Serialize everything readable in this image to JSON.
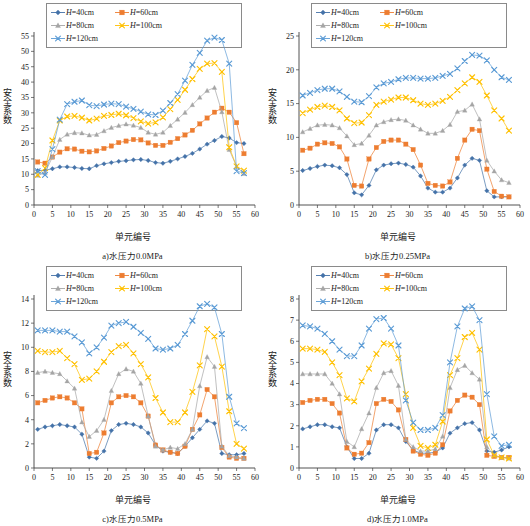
{
  "figure": {
    "panels": [
      "a",
      "b",
      "c",
      "d"
    ],
    "legend": [
      {
        "label": "H=40cm",
        "series": "H40",
        "color": "#4472a8",
        "marker": "diamond"
      },
      {
        "label": "H=60cm",
        "series": "H60",
        "color": "#ed7d31",
        "marker": "square"
      },
      {
        "label": "H=80cm",
        "series": "H80",
        "color": "#a5a5a5",
        "marker": "triangle"
      },
      {
        "label": "H=100cm",
        "series": "H100",
        "color": "#ffc000",
        "marker": "x"
      },
      {
        "label": "H=120cm",
        "series": "H120",
        "color": "#5b9bd5",
        "marker": "x"
      }
    ],
    "xlabel": "单元编号",
    "ylabel": "安全系数"
  },
  "chart_data": [
    {
      "type": "line",
      "panel": "a",
      "caption": "a)水压力0.0MPa",
      "title": "",
      "xlabel": "单元编号",
      "ylabel": "安全系数",
      "xlim": [
        0,
        60
      ],
      "ylim": [
        0,
        55
      ],
      "xticks": [
        0,
        5,
        10,
        15,
        20,
        25,
        30,
        35,
        40,
        45,
        50,
        55,
        60
      ],
      "yticks": [
        0,
        5,
        10,
        15,
        20,
        25,
        30,
        35,
        40,
        45,
        50,
        55
      ],
      "grid": false,
      "legend_position": "top",
      "x": [
        1,
        3,
        5,
        7,
        9,
        11,
        13,
        15,
        17,
        19,
        21,
        23,
        25,
        27,
        29,
        31,
        33,
        35,
        37,
        39,
        41,
        43,
        45,
        47,
        49,
        51,
        53,
        55,
        57
      ],
      "series": [
        {
          "name": "H=40cm",
          "color": "#4472a8",
          "marker": "diamond",
          "values": [
            11.2,
            11.3,
            11.8,
            12.4,
            12.4,
            12.2,
            11.9,
            11.8,
            12.8,
            13.4,
            13.8,
            14.2,
            14.4,
            14.7,
            14.8,
            14.5,
            13.8,
            13.6,
            14.2,
            15.0,
            15.8,
            16.8,
            18.2,
            19.8,
            21.0,
            22.3,
            21.8,
            20.3,
            20.0
          ]
        },
        {
          "name": "H=60cm",
          "color": "#ed7d31",
          "marker": "square",
          "values": [
            14.0,
            13.6,
            15.6,
            17.2,
            18.3,
            18.2,
            17.5,
            17.3,
            17.6,
            18.4,
            19.2,
            20.3,
            20.8,
            21.3,
            21.2,
            20.2,
            19.4,
            19.4,
            20.4,
            21.6,
            22.8,
            24.3,
            26.4,
            28.3,
            30.2,
            31.5,
            30.2,
            26.8,
            16.7
          ]
        },
        {
          "name": "H=80cm",
          "color": "#a5a5a5",
          "marker": "triangle",
          "values": [
            9.6,
            10.5,
            15.6,
            21.3,
            23.0,
            23.5,
            23.4,
            22.7,
            22.9,
            24.1,
            25.2,
            25.8,
            26.3,
            25.9,
            25.2,
            23.6,
            23.0,
            23.6,
            25.8,
            27.9,
            30.1,
            32.6,
            35.0,
            37.2,
            38.2,
            30.3,
            18.0,
            12.5,
            10.2
          ]
        },
        {
          "name": "H=100cm",
          "color": "#ffc000",
          "marker": "x",
          "values": [
            9.8,
            12.0,
            21.0,
            27.5,
            28.8,
            29.0,
            28.4,
            27.5,
            28.1,
            29.0,
            29.3,
            29.7,
            29.2,
            28.3,
            27.2,
            26.5,
            26.9,
            28.5,
            31.2,
            34.2,
            37.5,
            41.0,
            44.3,
            46.0,
            46.2,
            43.3,
            18.8,
            12.6,
            11.2
          ]
        },
        {
          "name": "H=120cm",
          "color": "#5b9bd5",
          "marker": "x",
          "values": [
            11.0,
            9.8,
            18.2,
            27.8,
            32.8,
            33.6,
            34.0,
            32.5,
            32.2,
            32.7,
            33.0,
            32.8,
            32.0,
            31.3,
            30.4,
            29.5,
            29.3,
            30.7,
            33.2,
            36.1,
            40.5,
            45.6,
            49.5,
            53.5,
            54.5,
            53.7,
            46.0,
            11.0,
            10.4
          ]
        }
      ]
    },
    {
      "type": "line",
      "panel": "b",
      "caption": "b)水压力0.25MPa",
      "title": "",
      "xlabel": "单元编号",
      "ylabel": "安全系数",
      "xlim": [
        0,
        60
      ],
      "ylim": [
        0,
        25
      ],
      "xticks": [
        0,
        5,
        10,
        15,
        20,
        25,
        30,
        35,
        40,
        45,
        50,
        55,
        60
      ],
      "yticks": [
        0,
        5,
        10,
        15,
        20,
        25
      ],
      "grid": false,
      "legend_position": "top",
      "x": [
        1,
        3,
        5,
        7,
        9,
        11,
        13,
        15,
        17,
        19,
        21,
        23,
        25,
        27,
        29,
        31,
        33,
        35,
        37,
        39,
        41,
        43,
        45,
        47,
        49,
        51,
        53,
        55,
        57
      ],
      "series": [
        {
          "name": "H=40cm",
          "color": "#4472a8",
          "marker": "diamond",
          "values": [
            5.1,
            5.4,
            5.7,
            5.9,
            5.8,
            5.5,
            4.5,
            1.8,
            1.5,
            2.9,
            5.2,
            5.9,
            6.1,
            6.2,
            6.0,
            5.6,
            4.3,
            2.5,
            1.9,
            1.9,
            2.5,
            4.0,
            5.9,
            6.9,
            6.6,
            2.1,
            1.2,
            1.2,
            1.2
          ]
        },
        {
          "name": "H=60cm",
          "color": "#ed7d31",
          "marker": "square",
          "values": [
            8.1,
            8.4,
            9.0,
            9.2,
            9.1,
            8.6,
            6.8,
            2.9,
            2.8,
            6.8,
            8.5,
            9.4,
            9.6,
            9.6,
            9.0,
            8.2,
            5.9,
            3.2,
            2.9,
            2.8,
            3.4,
            6.9,
            9.6,
            11.2,
            11.0,
            5.3,
            2.0,
            1.3,
            1.2
          ]
        },
        {
          "name": "H=80cm",
          "color": "#a5a5a5",
          "marker": "triangle",
          "values": [
            10.8,
            11.3,
            11.8,
            11.9,
            11.8,
            11.4,
            10.2,
            8.9,
            9.1,
            10.3,
            11.8,
            12.3,
            12.6,
            12.7,
            12.5,
            11.8,
            11.2,
            10.6,
            10.6,
            11.0,
            11.9,
            13.8,
            14.0,
            14.9,
            12.7,
            6.6,
            5.0,
            3.7,
            3.3
          ]
        },
        {
          "name": "H=100cm",
          "color": "#ffc000",
          "marker": "x",
          "values": [
            13.6,
            14.1,
            14.5,
            14.7,
            14.5,
            14.0,
            12.8,
            12.1,
            12.2,
            13.3,
            14.8,
            15.3,
            15.6,
            15.9,
            15.9,
            15.5,
            15.0,
            14.8,
            15.0,
            15.4,
            16.0,
            17.0,
            18.0,
            18.9,
            18.2,
            16.2,
            14.0,
            12.8,
            11.0
          ]
        },
        {
          "name": "H=120cm",
          "color": "#5b9bd5",
          "marker": "x",
          "values": [
            16.2,
            16.6,
            17.0,
            17.2,
            17.2,
            16.8,
            16.0,
            15.3,
            15.2,
            16.1,
            17.4,
            18.0,
            18.2,
            18.6,
            18.8,
            18.8,
            18.7,
            18.7,
            18.8,
            19.1,
            19.4,
            20.2,
            21.3,
            22.2,
            22.1,
            21.4,
            20.0,
            18.9,
            18.5
          ]
        }
      ]
    },
    {
      "type": "line",
      "panel": "c",
      "caption": "c)水压力0.5MPa",
      "title": "",
      "xlabel": "单元编号",
      "ylabel": "安全系数",
      "xlim": [
        0,
        60
      ],
      "ylim": [
        0,
        14
      ],
      "xticks": [
        0,
        5,
        10,
        15,
        20,
        25,
        30,
        35,
        40,
        45,
        50,
        55,
        60
      ],
      "yticks": [
        0,
        2,
        4,
        6,
        8,
        10,
        12,
        14
      ],
      "grid": false,
      "legend_position": "top",
      "x": [
        1,
        3,
        5,
        7,
        9,
        11,
        13,
        15,
        17,
        19,
        21,
        23,
        25,
        27,
        29,
        31,
        33,
        35,
        37,
        39,
        41,
        43,
        45,
        47,
        49,
        51,
        53,
        55,
        57
      ],
      "series": [
        {
          "name": "H=40cm",
          "color": "#4472a8",
          "marker": "diamond",
          "values": [
            3.2,
            3.4,
            3.5,
            3.6,
            3.5,
            3.4,
            2.8,
            0.9,
            0.8,
            1.4,
            3.1,
            3.6,
            3.7,
            3.6,
            3.4,
            2.9,
            1.9,
            1.4,
            1.3,
            1.2,
            1.8,
            2.5,
            3.2,
            3.9,
            3.7,
            1.2,
            1.1,
            1.1,
            1.2
          ]
        },
        {
          "name": "H=60cm",
          "color": "#ed7d31",
          "marker": "square",
          "values": [
            5.4,
            5.6,
            5.8,
            5.9,
            5.8,
            5.4,
            4.9,
            1.2,
            1.3,
            2.9,
            5.4,
            5.9,
            6.0,
            5.9,
            5.4,
            4.3,
            1.9,
            1.5,
            1.3,
            1.2,
            1.8,
            3.2,
            4.4,
            6.5,
            5.9,
            1.7,
            0.9,
            0.8,
            0.8
          ]
        },
        {
          "name": "H=80cm",
          "color": "#a5a5a5",
          "marker": "triangle",
          "values": [
            7.9,
            8.0,
            7.9,
            7.8,
            7.2,
            6.6,
            3.8,
            2.6,
            3.1,
            4.0,
            6.4,
            7.8,
            8.2,
            8.0,
            7.0,
            4.3,
            1.8,
            1.5,
            1.7,
            1.6,
            2.0,
            3.2,
            6.8,
            9.2,
            8.4,
            1.8,
            1.0,
            0.9,
            0.8
          ]
        },
        {
          "name": "H=100cm",
          "color": "#ffc000",
          "marker": "x",
          "values": [
            9.7,
            9.6,
            9.6,
            9.7,
            9.1,
            8.6,
            7.3,
            7.4,
            8.0,
            8.8,
            9.6,
            10.1,
            10.2,
            9.5,
            8.6,
            7.5,
            5.8,
            4.6,
            3.8,
            3.8,
            4.6,
            6.3,
            8.5,
            11.5,
            10.9,
            8.4,
            4.7,
            2.0,
            1.6
          ]
        },
        {
          "name": "H=120cm",
          "color": "#5b9bd5",
          "marker": "x",
          "values": [
            11.4,
            11.4,
            11.4,
            11.3,
            11.3,
            10.9,
            10.4,
            9.5,
            10.0,
            10.8,
            11.8,
            12.0,
            12.1,
            11.7,
            11.2,
            10.7,
            9.9,
            9.8,
            9.9,
            10.2,
            11.1,
            12.2,
            13.4,
            13.6,
            13.3,
            11.1,
            5.9,
            3.7,
            3.3
          ]
        }
      ]
    },
    {
      "type": "line",
      "panel": "d",
      "caption": "d)水压力1.0MPa",
      "title": "",
      "xlabel": "单元编号",
      "ylabel": "安全系数",
      "xlim": [
        0,
        60
      ],
      "ylim": [
        0,
        8
      ],
      "xticks": [
        0,
        5,
        10,
        15,
        20,
        25,
        30,
        35,
        40,
        45,
        50,
        55,
        60
      ],
      "yticks": [
        0,
        1,
        2,
        3,
        4,
        5,
        6,
        7,
        8
      ],
      "grid": false,
      "legend_position": "top",
      "x": [
        1,
        3,
        5,
        7,
        9,
        11,
        13,
        15,
        17,
        19,
        21,
        23,
        25,
        27,
        29,
        31,
        33,
        35,
        37,
        39,
        41,
        43,
        45,
        47,
        49,
        51,
        53,
        55,
        57
      ],
      "series": [
        {
          "name": "H=40cm",
          "color": "#4472a8",
          "marker": "diamond",
          "values": [
            1.85,
            1.95,
            2.05,
            2.05,
            1.95,
            1.9,
            1.0,
            0.45,
            0.45,
            0.7,
            1.8,
            2.05,
            2.05,
            1.9,
            1.25,
            0.85,
            0.7,
            0.7,
            0.75,
            0.95,
            1.65,
            1.9,
            2.1,
            2.15,
            1.8,
            0.8,
            0.75,
            0.85,
            1.0
          ]
        },
        {
          "name": "H=60cm",
          "color": "#ed7d31",
          "marker": "square",
          "values": [
            3.1,
            3.2,
            3.25,
            3.25,
            3.05,
            2.6,
            0.95,
            0.65,
            0.7,
            1.2,
            3.05,
            3.25,
            3.15,
            2.75,
            1.35,
            0.8,
            0.65,
            0.6,
            0.7,
            1.1,
            2.7,
            3.2,
            3.45,
            3.35,
            3.0,
            0.6,
            0.55,
            0.5,
            0.5
          ]
        },
        {
          "name": "H=80cm",
          "color": "#a5a5a5",
          "marker": "triangle",
          "values": [
            4.45,
            4.45,
            4.45,
            4.45,
            4.0,
            3.5,
            1.25,
            1.0,
            1.85,
            2.6,
            3.8,
            4.5,
            4.6,
            3.9,
            1.35,
            1.0,
            0.8,
            0.8,
            0.9,
            1.5,
            3.8,
            4.65,
            4.85,
            4.5,
            4.2,
            1.0,
            0.6,
            0.5,
            0.45
          ]
        },
        {
          "name": "H=100cm",
          "color": "#ffc000",
          "marker": "x",
          "values": [
            5.65,
            5.65,
            5.6,
            5.5,
            5.0,
            4.4,
            3.3,
            3.15,
            4.1,
            4.7,
            5.4,
            5.9,
            5.85,
            5.2,
            3.5,
            1.9,
            1.05,
            0.95,
            1.1,
            2.2,
            4.4,
            5.2,
            6.2,
            6.4,
            5.6,
            1.35,
            0.6,
            0.5,
            0.45
          ]
        },
        {
          "name": "H=120cm",
          "color": "#5b9bd5",
          "marker": "x",
          "values": [
            6.75,
            6.7,
            6.6,
            6.35,
            6.0,
            5.6,
            5.3,
            5.3,
            5.8,
            6.6,
            7.05,
            7.1,
            6.6,
            5.8,
            3.2,
            2.15,
            1.8,
            1.8,
            1.9,
            2.5,
            5.0,
            6.7,
            7.55,
            7.65,
            7.0,
            3.5,
            1.5,
            1.05,
            1.1
          ]
        }
      ]
    }
  ]
}
